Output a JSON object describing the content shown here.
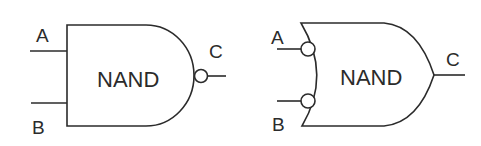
{
  "diagram": {
    "colors": {
      "stroke": "#2b2b2b",
      "background": "#ffffff"
    },
    "gates": [
      {
        "id": "and-style-nand",
        "shape": "AND body with output inversion bubble",
        "label": "NAND",
        "inputs": [
          {
            "name": "A"
          },
          {
            "name": "B"
          }
        ],
        "output": {
          "name": "C"
        }
      },
      {
        "id": "or-style-nand",
        "shape": "OR body with input inversion bubbles",
        "label": "NAND",
        "inputs": [
          {
            "name": "A"
          },
          {
            "name": "B"
          }
        ],
        "output": {
          "name": "C"
        }
      }
    ]
  }
}
